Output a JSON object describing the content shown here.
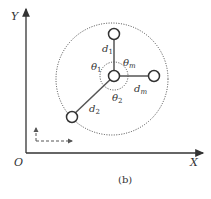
{
  "axes": {
    "x_label": "X",
    "y_label": "Y",
    "origin_label": "O"
  },
  "labels": {
    "d1": "d",
    "d1_sub": "1",
    "d2": "d",
    "d2_sub": "2",
    "dm": "d",
    "dm_sub": "m",
    "theta1": "θ",
    "theta1_sub": "1",
    "theta2": "θ",
    "theta2_sub": "2",
    "thetam": "θ",
    "thetam_sub": "m"
  },
  "caption": "(b)",
  "colors": {
    "stroke": "#333333",
    "background": "#ffffff"
  }
}
